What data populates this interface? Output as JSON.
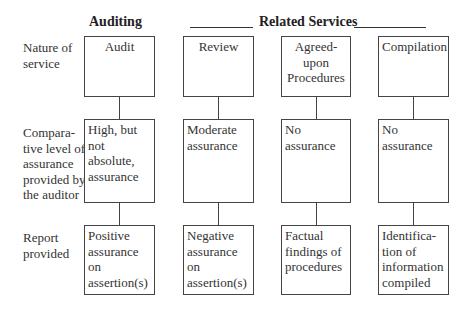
{
  "headers": {
    "auditing": "Auditing",
    "related_services": "Related Services"
  },
  "rows": [
    {
      "label": "Nature of service"
    },
    {
      "label": "Compara-tive level of assurance provided by the auditor"
    },
    {
      "label": "Report provided"
    }
  ],
  "row_labels": {
    "nature": [
      "Nature of",
      "service"
    ],
    "assurance": [
      "Compara-",
      "tive level of",
      "assurance",
      "provided by",
      "the auditor"
    ],
    "report": [
      "Report",
      "provided"
    ]
  },
  "columns": [
    {
      "nature": [
        "Audit"
      ],
      "assurance": [
        "High, but not",
        "absolute,",
        "assurance"
      ],
      "report": [
        "Positive",
        "assurance on",
        "assertion(s)"
      ]
    },
    {
      "nature": [
        "Review"
      ],
      "assurance": [
        "Moderate",
        "assurance"
      ],
      "report": [
        "Negative",
        "assurance on",
        "assertion(s)"
      ]
    },
    {
      "nature": [
        "Agreed-",
        "upon",
        "Procedures"
      ],
      "assurance": [
        "No",
        "assurance"
      ],
      "report": [
        "Factual",
        "findings of",
        "procedures"
      ]
    },
    {
      "nature": [
        "Compilation"
      ],
      "assurance": [
        "No",
        "assurance"
      ],
      "report": [
        "Identifica-",
        "tion of",
        "information",
        "compiled"
      ]
    }
  ]
}
